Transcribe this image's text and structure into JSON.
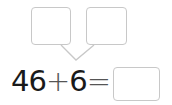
{
  "problem": {
    "operand_a": "46",
    "operator": "+",
    "operand_b": "6",
    "equals": "=",
    "answer": "",
    "split_boxes": [
      "",
      ""
    ]
  },
  "colors": {
    "box_border": "#c8c8c8",
    "text": "#1a1a1a"
  }
}
